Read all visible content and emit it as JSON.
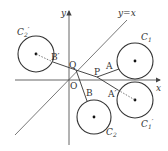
{
  "diagram": {
    "axes": {
      "x_label": "x",
      "y_label": "y",
      "origin_label": "O"
    },
    "line_label": "y=x",
    "circles": [
      {
        "name": "C1",
        "label_main": "C",
        "label_sub": "1",
        "prime": ""
      },
      {
        "name": "C1'",
        "label_main": "C",
        "label_sub": "1",
        "prime": "′"
      },
      {
        "name": "C2",
        "label_main": "C",
        "label_sub": "2",
        "prime": ""
      },
      {
        "name": "C2'",
        "label_main": "C",
        "label_sub": "2",
        "prime": "′"
      }
    ],
    "points": {
      "P": "P",
      "Q": "Q",
      "A": "A",
      "A_prime": "A′",
      "B": "B",
      "B_prime": "B′"
    },
    "colors": {
      "stroke": "#333333",
      "axis": "#555555"
    }
  }
}
